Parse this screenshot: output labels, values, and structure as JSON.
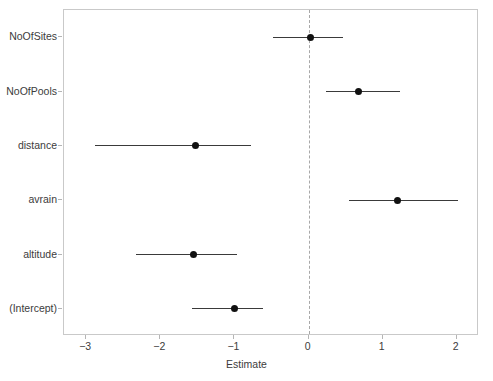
{
  "chart_data": {
    "type": "scatter",
    "subtype": "coefficient-forest-plot",
    "title": "",
    "subtitle": "",
    "xlabel": "Estimate",
    "ylabel": "",
    "xlim": [
      -3.3,
      2.3
    ],
    "xticks": [
      -3,
      -2,
      -1,
      0,
      1,
      2
    ],
    "xticklabels": [
      "−3",
      "−2",
      "−1",
      "0",
      "1",
      "2"
    ],
    "grid": false,
    "legend": null,
    "reference_line": {
      "x": 0,
      "style": "dashed",
      "color": "#a8a8a8"
    },
    "categories": [
      "NoOfSites",
      "NoOfPools",
      "distance",
      "avrain",
      "altitude",
      "(Intercept)"
    ],
    "point_color": "#111111",
    "line_color": "#3a3a3a",
    "points": [
      {
        "term": "NoOfSites",
        "estimate": 0.02,
        "conf_low": -0.48,
        "conf_high": 0.47
      },
      {
        "term": "NoOfPools",
        "estimate": 0.67,
        "conf_low": 0.23,
        "conf_high": 1.23
      },
      {
        "term": "distance",
        "estimate": -1.52,
        "conf_low": -2.88,
        "conf_high": -0.78
      },
      {
        "term": "avrain",
        "estimate": 1.2,
        "conf_low": 0.54,
        "conf_high": 2.02
      },
      {
        "term": "altitude",
        "estimate": -1.55,
        "conf_low": -2.33,
        "conf_high": -0.97
      },
      {
        "term": "(Intercept)",
        "estimate": -1.0,
        "conf_low": -1.57,
        "conf_high": -0.61
      }
    ]
  }
}
